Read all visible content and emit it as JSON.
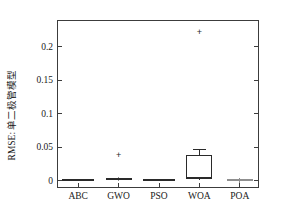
{
  "chart_data": {
    "type": "box",
    "title": "",
    "xlabel": "",
    "ylabel": "RMSE: 单二极管模型",
    "categories": [
      "ABC",
      "GWO",
      "PSO",
      "WOA",
      "POA"
    ],
    "ylim": [
      -0.012,
      0.238
    ],
    "yticks": [
      0,
      0.05,
      0.1,
      0.15,
      0.2
    ],
    "ytick_labels": [
      "0",
      "0.05",
      "0.1",
      "0.15",
      "0.2"
    ],
    "grid": false,
    "legend": null,
    "boxes": [
      {
        "name": "ABC",
        "q1": 0.0005,
        "median": 0.001,
        "q3": 0.0015,
        "whisker_low": 0.0005,
        "whisker_high": 0.0015,
        "outliers": []
      },
      {
        "name": "GWO",
        "q1": 0.0015,
        "median": 0.003,
        "q3": 0.005,
        "whisker_low": 0.0,
        "whisker_high": 0.006,
        "outliers": [
          0.039
        ]
      },
      {
        "name": "PSO",
        "q1": 0.0005,
        "median": 0.001,
        "q3": 0.0018,
        "whisker_low": 0.0005,
        "whisker_high": 0.0018,
        "outliers": []
      },
      {
        "name": "WOA",
        "q1": 0.003,
        "median": 0.004,
        "q3": 0.039,
        "whisker_low": 0.002,
        "whisker_high": 0.047,
        "outliers": [
          0.222
        ]
      },
      {
        "name": "POA",
        "q1": 0.0005,
        "median": 0.001,
        "q3": 0.0015,
        "whisker_low": -0.003,
        "whisker_high": 0.005,
        "outliers": []
      }
    ]
  },
  "colors": {
    "axis": "#3c3c3c",
    "box": "#2a2a2a",
    "text": "#1a1a1a",
    "faint": "#8f8f8f",
    "background": "#ffffff"
  }
}
